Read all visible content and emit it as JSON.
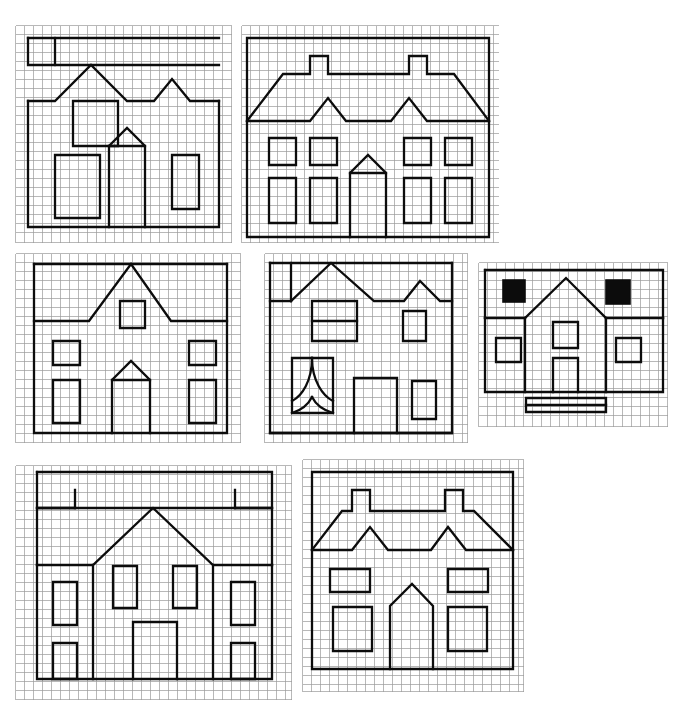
{
  "page": {
    "background_color": "#ffffff",
    "grid_color": "#9a9a9a",
    "ink_color": "#0c0c0c",
    "cell_size_px": 9,
    "panel_count": 7
  },
  "panels": [
    {
      "id": "panel-1",
      "name": "house-drawing-1",
      "label": "House with double-peak roof and three windows",
      "x": 15,
      "y": 25,
      "w": 217,
      "h": 218,
      "cols": 24,
      "rows": 24,
      "features": [
        "chimney-step",
        "twin-gable-roof",
        "square-window",
        "rectangle-window",
        "gabled-door",
        "tall-window"
      ],
      "filled_squares": 0
    },
    {
      "id": "panel-2",
      "name": "house-drawing-2",
      "label": "Wide house with two chimneys, two gables, six windows and arched door",
      "x": 241,
      "y": 25,
      "w": 258,
      "h": 218,
      "cols": 28,
      "rows": 24,
      "features": [
        "two-chimneys",
        "twin-gable-roof",
        "four-small-windows",
        "four-tall-windows",
        "arched-door"
      ],
      "filled_squares": 0
    },
    {
      "id": "panel-3",
      "name": "house-drawing-3",
      "label": "House with central triangular gable, attic window and arched door",
      "x": 15,
      "y": 253,
      "w": 226,
      "h": 190,
      "cols": 25,
      "rows": 21,
      "features": [
        "central-gable",
        "attic-window",
        "two-small-windows",
        "two-tall-windows",
        "arched-door"
      ],
      "filled_squares": 0
    },
    {
      "id": "panel-4",
      "name": "house-drawing-4",
      "label": "House with stepped roof, divided window, curved arch window and plain door",
      "x": 264,
      "y": 253,
      "w": 204,
      "h": 190,
      "cols": 22,
      "rows": 21,
      "features": [
        "chimney-step",
        "twin-gable-roof",
        "divided-window",
        "curved-arch-window",
        "small-window",
        "door",
        "tall-window"
      ],
      "filled_squares": 0
    },
    {
      "id": "panel-5",
      "name": "house-drawing-5",
      "label": "Small house with two solid black windows, central gable and doorstep",
      "x": 478,
      "y": 262,
      "w": 190,
      "h": 165,
      "cols": 21,
      "rows": 18,
      "features": [
        "two-black-filled-windows",
        "central-gable",
        "attic-window",
        "door",
        "two-side-windows",
        "doorstep"
      ],
      "filled_squares": 2
    },
    {
      "id": "panel-6",
      "name": "house-drawing-6",
      "label": "Large house with parapet, two roof notches, central gable and six windows",
      "x": 15,
      "y": 465,
      "w": 277,
      "h": 235,
      "cols": 30,
      "rows": 26,
      "features": [
        "parapet",
        "two-roof-notches",
        "central-gable",
        "six-windows",
        "wide-door"
      ],
      "filled_squares": 0
    },
    {
      "id": "panel-7",
      "name": "house-drawing-7",
      "label": "House with two chimneys, twin gables, four windows and arched door",
      "x": 302,
      "y": 459,
      "w": 222,
      "h": 233,
      "cols": 24,
      "rows": 26,
      "features": [
        "two-chimneys",
        "twin-gable-roof",
        "two-wide-windows",
        "two-square-windows",
        "arched-door"
      ],
      "filled_squares": 0
    }
  ]
}
